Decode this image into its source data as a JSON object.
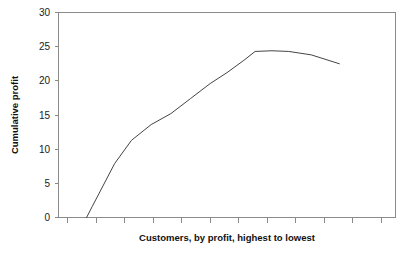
{
  "chart_data": {
    "type": "line",
    "title": "",
    "subtitle": "",
    "xlabel": "Customers, by profit, highest to lowest",
    "ylabel": "Cumulative profit",
    "ylim": [
      0,
      30
    ],
    "yticks": [
      0,
      5,
      10,
      15,
      20,
      25,
      30
    ],
    "ytick_labels": [
      "0",
      "5",
      "10",
      "15",
      "20",
      "25",
      "30"
    ],
    "xlim": [
      0,
      12
    ],
    "xticks": [
      1,
      2,
      3,
      4,
      5,
      6,
      7,
      8,
      9,
      10,
      11,
      12
    ],
    "xtick_labels": [
      "",
      "",
      "",
      "",
      "",
      "",
      "",
      "",
      "",
      "",
      "",
      ""
    ],
    "grid": false,
    "legend": null,
    "legend_position": "none",
    "annotations": [],
    "series": [
      {
        "name": "Cumulative profit",
        "color": "#444444",
        "x": [
          1.0,
          1.2,
          2.0,
          2.6,
          3.3,
          4.0,
          4.7,
          5.4,
          6.0,
          6.6,
          7.0,
          7.6,
          8.2,
          9.0,
          10.0
        ],
        "values": [
          0.0,
          1.6,
          7.9,
          11.3,
          13.6,
          15.2,
          17.4,
          19.6,
          21.2,
          23.0,
          24.3,
          24.4,
          24.3,
          23.8,
          22.5
        ]
      }
    ]
  },
  "axes": {
    "y_axis_title": "Cumulative profit",
    "x_axis_title": "Customers, by profit, highest to lowest",
    "tick_color": "#8a8a8a",
    "frame_color": "#8a8a8a",
    "line_color": "#444444",
    "background": "#ffffff"
  }
}
